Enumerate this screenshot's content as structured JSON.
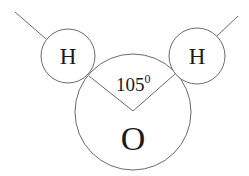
{
  "diagram": {
    "type": "molecule",
    "atoms": [
      {
        "id": "H-left",
        "label": "H"
      },
      {
        "id": "O",
        "label": "O"
      },
      {
        "id": "H-right",
        "label": "H"
      }
    ],
    "bond_angle": {
      "value": "105",
      "unit": "0"
    },
    "colors": {
      "stroke": "#6a6a6a",
      "text": "#1a1a1a",
      "background": "#ffffff"
    }
  }
}
